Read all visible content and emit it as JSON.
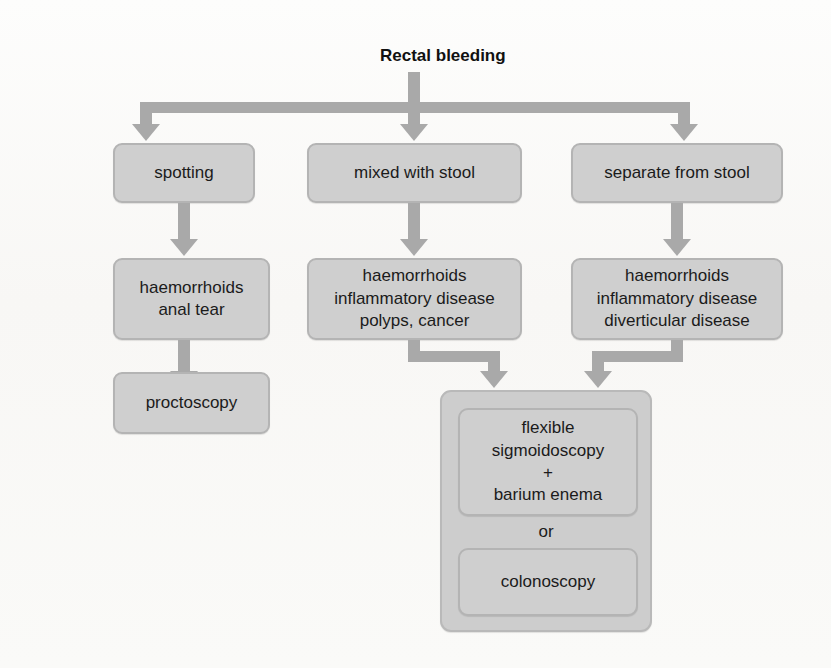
{
  "figure": {
    "type": "flowchart",
    "title": "Rectal bleeding",
    "palette": {
      "box_fill": "#cfcfcf",
      "box_border": "#b4b4b4",
      "connector": "#a9a9a9",
      "text": "#1b1b1b",
      "background": "#fbfaf8"
    }
  },
  "nodes": {
    "root": {
      "label": "Rectal bleeding"
    },
    "branch_left": {
      "label": "spotting"
    },
    "branch_middle": {
      "label": "mixed with stool"
    },
    "branch_right": {
      "label": "separate from stool"
    },
    "causes_left": {
      "label": "haemorrhoids\nanal tear"
    },
    "causes_middle": {
      "label": "haemorrhoids\ninflammatory disease\npolyps, cancer"
    },
    "causes_right": {
      "label": "haemorrhoids\ninflammatory disease\ndiverticular disease"
    },
    "investigation_left": {
      "label": "proctoscopy"
    },
    "investigation_group": {
      "option_a": {
        "label": "flexible\nsigmoidoscopy\n+\nbarium enema"
      },
      "connector_word": "or",
      "option_b": {
        "label": "colonoscopy"
      }
    }
  },
  "edges": [
    {
      "from": "root",
      "to": "branch_left",
      "style": "arrow"
    },
    {
      "from": "root",
      "to": "branch_middle",
      "style": "arrow"
    },
    {
      "from": "root",
      "to": "branch_right",
      "style": "arrow"
    },
    {
      "from": "branch_left",
      "to": "causes_left",
      "style": "arrow"
    },
    {
      "from": "branch_middle",
      "to": "causes_middle",
      "style": "arrow"
    },
    {
      "from": "branch_right",
      "to": "causes_right",
      "style": "arrow"
    },
    {
      "from": "causes_left",
      "to": "investigation_left",
      "style": "arrow"
    },
    {
      "from": "causes_middle",
      "to": "investigation_group",
      "style": "arrow"
    },
    {
      "from": "causes_right",
      "to": "investigation_group",
      "style": "arrow"
    }
  ]
}
